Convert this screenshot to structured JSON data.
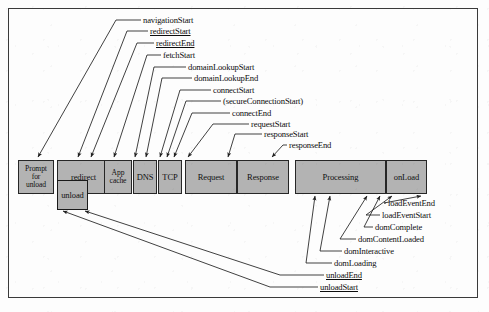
{
  "diagram": {
    "colors": {
      "box_fill": "#b3b3b3",
      "box_stroke": "#262626",
      "frame_stroke": "#3a3a3a",
      "line": "#1f1f1f",
      "background": "#fdfdfd",
      "text": "#0d0d0d"
    },
    "frame": {
      "x": 8,
      "y": 8,
      "width": 470,
      "height": 290
    }
  },
  "phases": [
    {
      "id": "prompt-for-unload",
      "label": "Prompt\nfor\nunload",
      "lines": [
        "Prompt",
        "for",
        "unload"
      ],
      "x": 18,
      "y": 160,
      "w": 36,
      "h": 34
    },
    {
      "id": "redirect",
      "label": "redirect",
      "lines": [
        "redirect"
      ],
      "x": 57,
      "y": 160,
      "w": 53,
      "h": 34
    },
    {
      "id": "app-cache",
      "label": "App\ncache",
      "lines": [
        "App",
        "cache"
      ],
      "x": 104,
      "y": 160,
      "w": 28,
      "h": 34
    },
    {
      "id": "dns",
      "label": "DNS",
      "lines": [
        "DNS"
      ],
      "x": 133,
      "y": 160,
      "w": 24,
      "h": 34
    },
    {
      "id": "tcp",
      "label": "TCP",
      "lines": [
        "TCP"
      ],
      "x": 158,
      "y": 160,
      "w": 24,
      "h": 34
    },
    {
      "id": "request",
      "label": "Request",
      "lines": [
        "Request"
      ],
      "x": 185,
      "y": 160,
      "w": 52,
      "h": 34
    },
    {
      "id": "response",
      "label": "Response",
      "lines": [
        "Response"
      ],
      "x": 237,
      "y": 160,
      "w": 52,
      "h": 34
    },
    {
      "id": "processing",
      "label": "Processing",
      "lines": [
        "Processing"
      ],
      "x": 295,
      "y": 160,
      "w": 91,
      "h": 34
    },
    {
      "id": "onload",
      "label": "onLoad",
      "lines": [
        "onLoad"
      ],
      "x": 386,
      "y": 160,
      "w": 41,
      "h": 34
    }
  ],
  "unload_box": {
    "id": "unload",
    "label": "unload",
    "x": 57,
    "y": 180,
    "w": 31,
    "h": 30
  },
  "top_labels": [
    {
      "id": "navigationStart",
      "text": "navigationStart",
      "x": 143,
      "y": 16,
      "underline": false,
      "elbow_x": 116,
      "tip_x": 38,
      "tip_y": 157
    },
    {
      "id": "redirectStart",
      "text": "redirectStart",
      "x": 150,
      "y": 27,
      "underline": true,
      "elbow_x": 127,
      "tip_x": 78,
      "tip_y": 157
    },
    {
      "id": "redirectEnd",
      "text": "redirectEnd",
      "x": 156,
      "y": 39,
      "underline": true,
      "elbow_x": 137,
      "tip_x": 91,
      "tip_y": 157
    },
    {
      "id": "fetchStart",
      "text": "fetchStart",
      "x": 163,
      "y": 51,
      "underline": false,
      "elbow_x": 147,
      "tip_x": 114,
      "tip_y": 157
    },
    {
      "id": "domainLookupStart",
      "text": "domainLookupStart",
      "x": 188,
      "y": 63,
      "underline": false,
      "elbow_x": 154,
      "tip_x": 135,
      "tip_y": 157
    },
    {
      "id": "domainLookupEnd",
      "text": "domainLookupEnd",
      "x": 194,
      "y": 74,
      "underline": false,
      "elbow_x": 162,
      "tip_x": 146,
      "tip_y": 157
    },
    {
      "id": "connectStart",
      "text": "connectStart",
      "x": 213,
      "y": 86,
      "underline": false,
      "elbow_x": 180,
      "tip_x": 160,
      "tip_y": 157
    },
    {
      "id": "secureConnectionStart",
      "text": "(secureConnectionStart)",
      "x": 223,
      "y": 97,
      "underline": false,
      "elbow_x": 186,
      "tip_x": 167,
      "tip_y": 157
    },
    {
      "id": "connectEnd",
      "text": "connectEnd",
      "x": 232,
      "y": 109,
      "underline": false,
      "elbow_x": 192,
      "tip_x": 174,
      "tip_y": 157
    },
    {
      "id": "requestStart",
      "text": "requestStart",
      "x": 251,
      "y": 120,
      "underline": false,
      "elbow_x": 213,
      "tip_x": 188,
      "tip_y": 157
    },
    {
      "id": "responseStart",
      "text": "responseStart",
      "x": 264,
      "y": 130,
      "underline": false,
      "elbow_x": 235,
      "tip_x": 228,
      "tip_y": 157
    },
    {
      "id": "responseEnd",
      "text": "responseEnd",
      "x": 289,
      "y": 141,
      "underline": false,
      "elbow_x": 283,
      "tip_x": 272,
      "tip_y": 157
    }
  ],
  "bottom_labels": [
    {
      "id": "loadEventEnd",
      "text": "loadEventEnd",
      "x": 388,
      "y": 199,
      "underline": false,
      "elbow_x": 384,
      "tip_x": 421,
      "tip_y": 196
    },
    {
      "id": "loadEventStart",
      "text": "loadEventStart",
      "x": 382,
      "y": 211,
      "underline": false,
      "elbow_x": 366,
      "tip_x": 392,
      "tip_y": 196
    },
    {
      "id": "domComplete",
      "text": "domComplete",
      "x": 375,
      "y": 223,
      "underline": false,
      "elbow_x": 364,
      "tip_x": 380,
      "tip_y": 196
    },
    {
      "id": "domContentLoaded",
      "text": "domContentLoaded",
      "x": 358,
      "y": 235,
      "underline": false,
      "elbow_x": 340,
      "tip_x": 367,
      "tip_y": 196
    },
    {
      "id": "domInteractive",
      "text": "domInteractive",
      "x": 344,
      "y": 247,
      "underline": false,
      "elbow_x": 320,
      "tip_x": 330,
      "tip_y": 196
    },
    {
      "id": "domLoading",
      "text": "domLoading",
      "x": 334,
      "y": 259,
      "underline": false,
      "elbow_x": 306,
      "tip_x": 315,
      "tip_y": 196
    },
    {
      "id": "unloadEnd",
      "text": "unloadEnd",
      "x": 326,
      "y": 271,
      "underline": true,
      "elbow_x": 280,
      "tip_x": 85,
      "tip_y": 211
    },
    {
      "id": "unloadStart",
      "text": "unloadStart",
      "x": 320,
      "y": 283,
      "underline": true,
      "elbow_x": 270,
      "tip_x": 63,
      "tip_y": 211
    }
  ]
}
